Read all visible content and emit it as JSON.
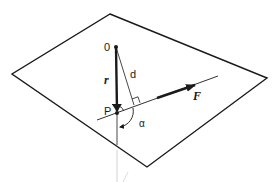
{
  "diagram": {
    "title": "",
    "labels": {
      "origin": "0",
      "point": "P",
      "position_vector": "r",
      "distance": "d",
      "force": "F",
      "angle": "α"
    },
    "colors": {
      "stroke": "#1a1a1a",
      "faint": "#bdbdbd",
      "background": "#ffffff"
    }
  }
}
